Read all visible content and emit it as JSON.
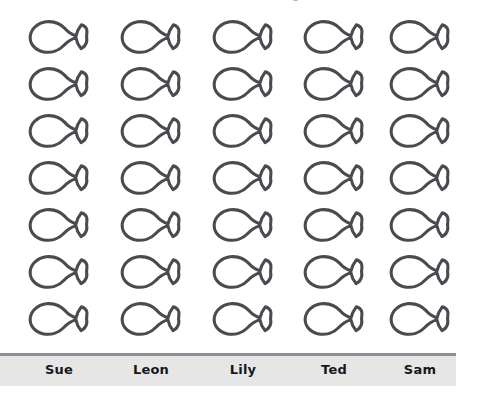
{
  "page": {
    "background_color": "#ffffff",
    "width": 480,
    "height": 401,
    "clipped_title_fragment": "Number of fish caught"
  },
  "axis": {
    "rule_color": "#8e8e96",
    "label_band_color": "#e6e6e6",
    "label_text_color": "#17171a"
  },
  "icon": {
    "name": "fish-icon",
    "outline_color": "#4a4a50",
    "fill_color": "#ffffff",
    "orientation": "facing-left",
    "value_each": 1
  },
  "chart_data": {
    "type": "bar",
    "subtype": "pictograph",
    "title": "",
    "xlabel": "",
    "ylabel": "",
    "categories": [
      "Sue",
      "Leon",
      "Lily",
      "Ted",
      "Sam"
    ],
    "values": [
      7,
      7,
      7,
      7,
      7
    ],
    "icon_unit_value": 1,
    "rows": 7,
    "columns": 5,
    "total_icons": 35,
    "grid": false,
    "legend": "none",
    "ylim": [
      0,
      7
    ]
  },
  "columns": [
    {
      "label": "Sue",
      "count": 7,
      "center_x": 59
    },
    {
      "label": "Leon",
      "count": 7,
      "center_x": 151
    },
    {
      "label": "Lily",
      "count": 7,
      "center_x": 243
    },
    {
      "label": "Ted",
      "count": 7,
      "center_x": 334
    },
    {
      "label": "Sam",
      "count": 7,
      "center_x": 420
    }
  ],
  "rows": [
    {
      "index": 1,
      "top": 6
    },
    {
      "index": 2,
      "top": 53
    },
    {
      "index": 3,
      "top": 100
    },
    {
      "index": 4,
      "top": 147
    },
    {
      "index": 5,
      "top": 194
    },
    {
      "index": 6,
      "top": 241
    },
    {
      "index": 7,
      "top": 288
    }
  ]
}
